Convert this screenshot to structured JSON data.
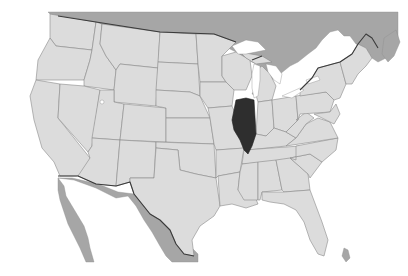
{
  "map": {
    "title": "Illinois locator map",
    "subject": "Contiguous United States",
    "highlighted_state": "Illinois",
    "regions_shown": [
      "United States",
      "Canada",
      "Mexico",
      "Bahamas",
      "Cuba"
    ],
    "colors": {
      "highlight": "#2e2e2e",
      "us_states": "#dcdcdc",
      "foreign_land": "#a6a6a6",
      "water": "#ffffff",
      "state_borders": "#8a8a8a",
      "international_border": "#3a3a3a"
    }
  }
}
